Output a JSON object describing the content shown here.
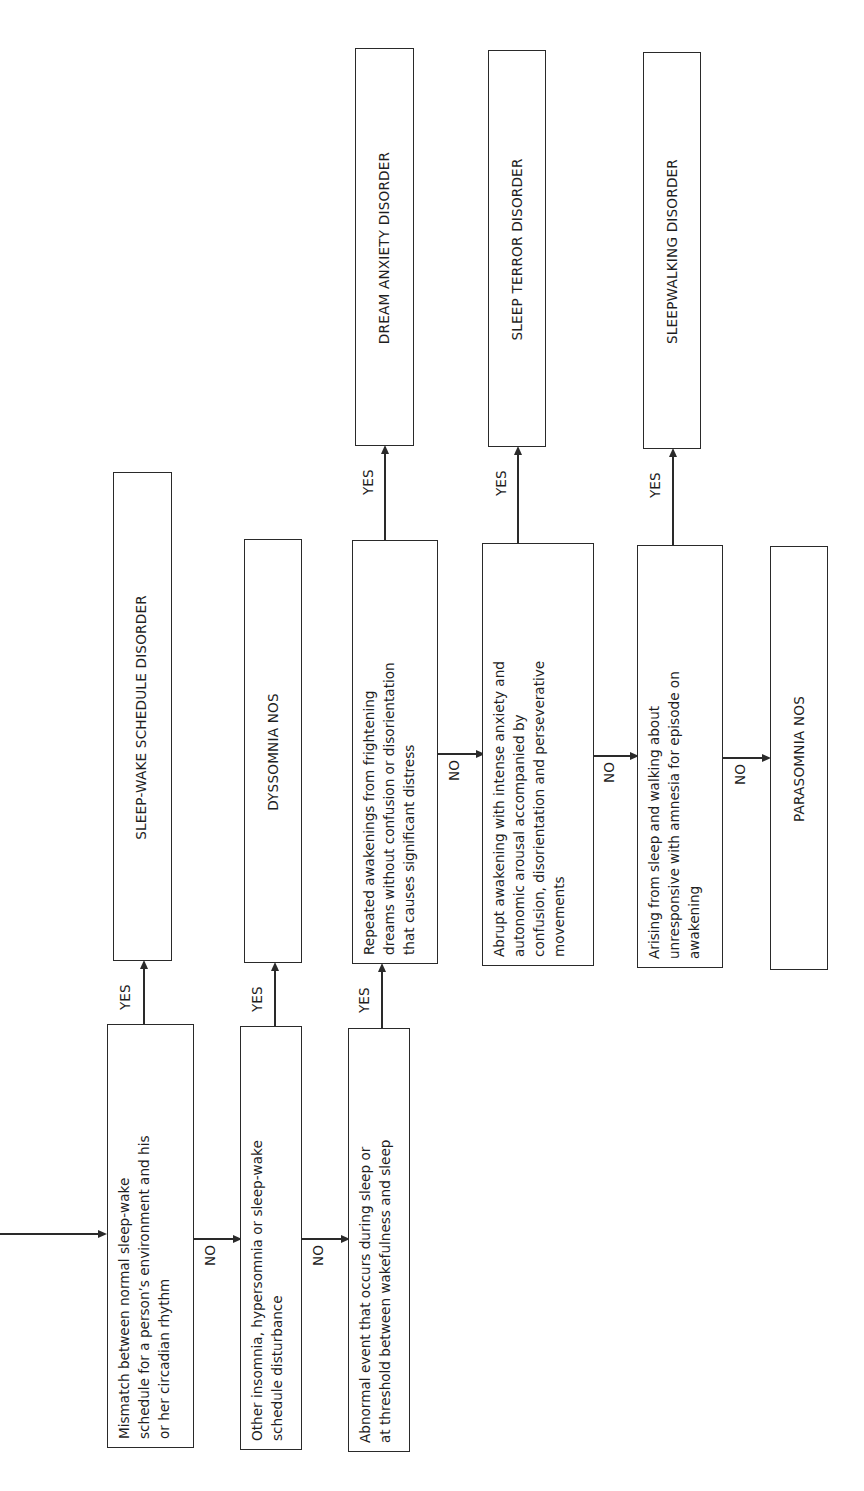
{
  "diagram": {
    "orientation": "rotated 90 degrees counter-clockwise",
    "entry_arrow": "incoming arrow into first decision",
    "decisions": [
      {
        "id": "d1",
        "text": "Mismatch between normal sleep-wake schedule for a person's environment and his or her circadian rhythm",
        "lines": [
          "Mismatch between normal sleep-wake",
          "schedule for a person’s environment and his",
          "or her circadian rhythm"
        ],
        "yes_label": "YES",
        "no_label": "NO"
      },
      {
        "id": "d2",
        "text": "Other insomnia, hypersomnia or sleep-wake schedule disturbance",
        "lines": [
          "Other insomnia, hypersomnia or sleep-wake",
          "schedule disturbance"
        ],
        "yes_label": "YES",
        "no_label": "NO"
      },
      {
        "id": "d3",
        "text": "Abnormal event that occurs during sleep or at threshold between wakefulness and sleep",
        "lines": [
          "Abnormal event that occurs during sleep or",
          "at threshold between wakefulness and sleep"
        ],
        "yes_label": "YES"
      },
      {
        "id": "d4",
        "text": "Repeated awakenings from frightening dreams without confusion or disorientation that causes significant distress",
        "lines": [
          "Repeated awakenings from frightening",
          "dreams without confusion or disorientation",
          "that causes significant distress"
        ],
        "yes_label": "YES",
        "no_label": "NO"
      },
      {
        "id": "d5",
        "text": "Abrupt awakening with intense anxiety and autonomic arousal accompanied by confusion, disorientation and perseverative movements",
        "lines": [
          "Abrupt awakening with intense anxiety and",
          "autonomic arousal accompanied by",
          "confusion, disorientation and perseverative",
          "movements"
        ],
        "yes_label": "YES",
        "no_label": "NO"
      },
      {
        "id": "d6",
        "text": "Arising from sleep and walking about unresponsive with amnesia for episode on awakening",
        "lines": [
          "Arising from sleep and walking about",
          "unresponsive with amnesia for episode on",
          "awakening"
        ],
        "yes_label": "YES",
        "no_label": "NO"
      }
    ],
    "outcomes": [
      {
        "id": "o1",
        "label": "SLEEP-WAKE SCHEDULE DISORDER",
        "from": "d1",
        "via": "YES"
      },
      {
        "id": "o2",
        "label": "DYSSOMNIA NOS",
        "from": "d2",
        "via": "YES"
      },
      {
        "id": "o3",
        "label": "DREAM ANXIETY DISORDER",
        "from": "d4",
        "via": "YES"
      },
      {
        "id": "o4",
        "label": "SLEEP TERROR DISORDER",
        "from": "d5",
        "via": "YES"
      },
      {
        "id": "o5",
        "label": "SLEEPWALKING DISORDER",
        "from": "d6",
        "via": "YES"
      },
      {
        "id": "o6",
        "label": "PARASOMNIA NOS",
        "from": "d6",
        "via": "NO"
      }
    ],
    "edges": [
      {
        "from": "d1",
        "to": "d2",
        "label": "NO"
      },
      {
        "from": "d2",
        "to": "d3",
        "label": "NO"
      },
      {
        "from": "d3",
        "to": "d4",
        "label": "YES"
      },
      {
        "from": "d4",
        "to": "d5",
        "label": "NO"
      },
      {
        "from": "d5",
        "to": "d6",
        "label": "NO"
      },
      {
        "from": "d6",
        "to": "o6",
        "label": "NO"
      }
    ]
  }
}
